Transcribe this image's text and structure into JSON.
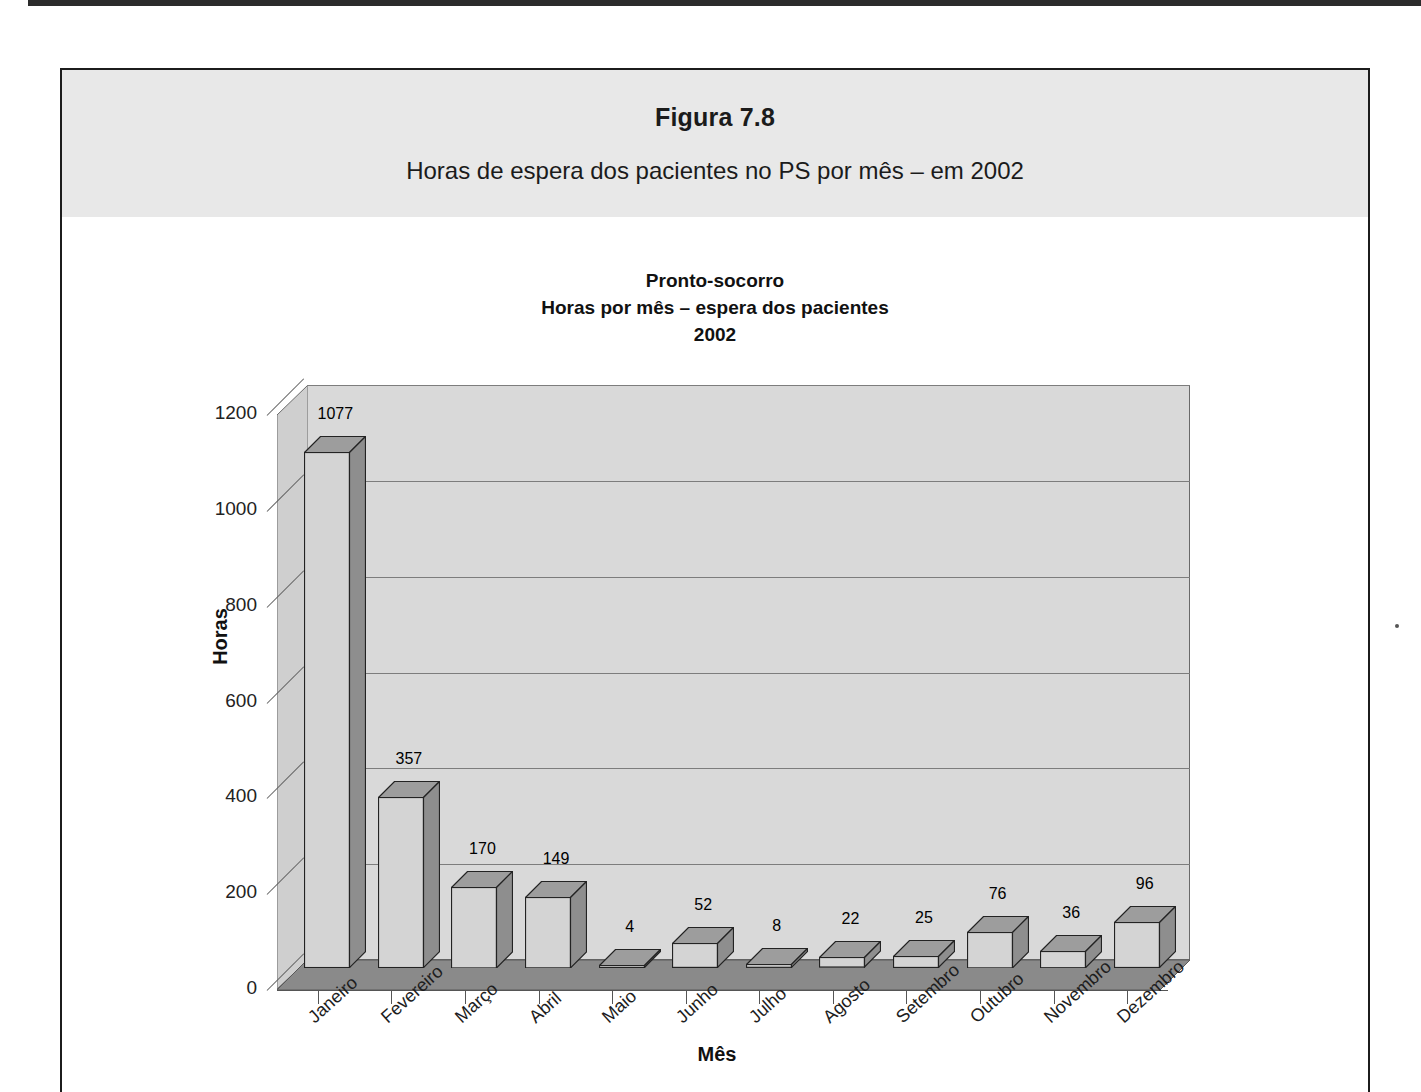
{
  "figure": {
    "title": "Figura 7.8",
    "subtitle": "Horas de espera dos pacientes no PS por mês – em 2002"
  },
  "chart_data": {
    "type": "bar",
    "title_lines": [
      "Pronto-socorro",
      "Horas por mês – espera dos pacientes",
      "2002"
    ],
    "xlabel": "Mês",
    "ylabel": "Horas",
    "ylim": [
      0,
      1200
    ],
    "ytick_step": 200,
    "yticks": [
      "0",
      "200",
      "400",
      "600",
      "800",
      "1000",
      "1200"
    ],
    "grid": true,
    "legend": "none",
    "style": "3d-column",
    "categories": [
      "Janeiro",
      "Fevereiro",
      "Março",
      "Abril",
      "Maio",
      "Junho",
      "Julho",
      "Agosto",
      "Setembro",
      "Outubro",
      "Novembro",
      "Dezembro"
    ],
    "values": [
      1077,
      357,
      170,
      149,
      4,
      52,
      8,
      22,
      25,
      76,
      36,
      96
    ],
    "data_labels": [
      "1077",
      "357",
      "170",
      "149",
      "4",
      "52",
      "8",
      "22",
      "25",
      "76",
      "36",
      "96"
    ]
  },
  "colors": {
    "header_band": "#e8e8e8",
    "back_wall": "#d9d9d9",
    "left_wall": "#cfcfcf",
    "floor": "#8a8a8a",
    "bar_face": "#d4d4d4",
    "bar_side": "#8e8e8e",
    "bar_top": "#9d9d9d",
    "frame": "#1c1c1c",
    "text": "#1b1b1b"
  }
}
